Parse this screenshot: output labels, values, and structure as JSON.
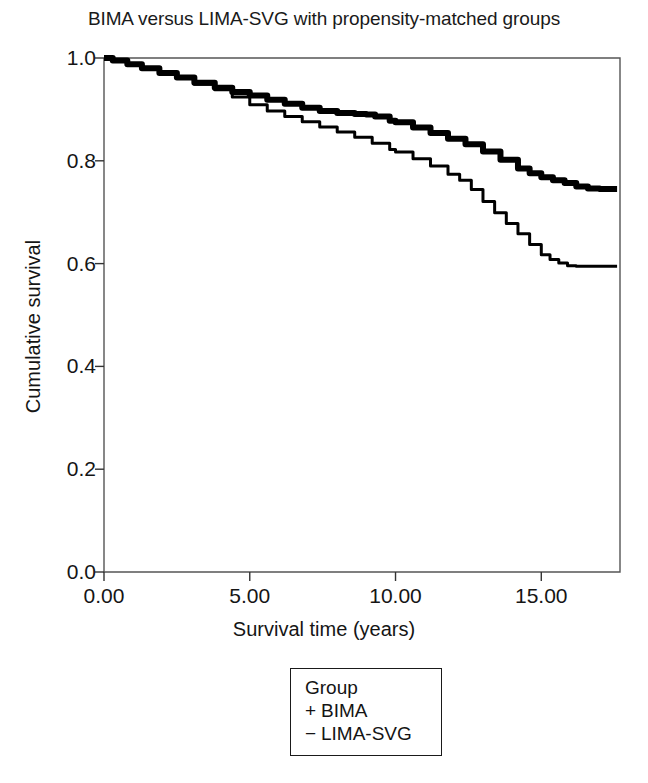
{
  "chart_data": {
    "type": "line",
    "title": "BIMA versus LIMA-SVG with propensity-matched groups",
    "subtitle": "",
    "xlabel": "Survival time (years)",
    "ylabel": "Cumulative survival",
    "xlim": [
      0,
      17.7
    ],
    "ylim": [
      0.0,
      1.0
    ],
    "grid": false,
    "legend_position": "below-plot",
    "legend_title": "Group",
    "xticks": [
      0,
      5,
      10,
      15
    ],
    "xtick_labels": [
      "0.00",
      "5.00",
      "10.00",
      "15.00"
    ],
    "yticks": [
      0.0,
      0.2,
      0.4,
      0.6,
      0.8,
      1.0
    ],
    "ytick_labels": [
      "0.0",
      "0.2",
      "0.4",
      "0.6",
      "0.8",
      "1.0"
    ],
    "series": [
      {
        "name": "BIMA",
        "marker": "+",
        "color": "#000000",
        "line_width": 6,
        "x": [
          0.0,
          0.3,
          0.8,
          1.3,
          1.9,
          2.5,
          3.1,
          3.8,
          4.4,
          5.0,
          5.6,
          6.2,
          6.8,
          7.4,
          8.0,
          8.6,
          9.0,
          9.3,
          9.8,
          10.0,
          10.6,
          11.2,
          11.8,
          12.4,
          13.0,
          13.6,
          14.2,
          14.6,
          15.0,
          15.4,
          15.8,
          16.2,
          16.6,
          17.0,
          17.4,
          17.6
        ],
        "y": [
          1.0,
          0.995,
          0.988,
          0.98,
          0.971,
          0.962,
          0.952,
          0.942,
          0.934,
          0.927,
          0.919,
          0.911,
          0.903,
          0.897,
          0.893,
          0.891,
          0.89,
          0.886,
          0.878,
          0.875,
          0.865,
          0.854,
          0.843,
          0.832,
          0.818,
          0.802,
          0.785,
          0.776,
          0.768,
          0.762,
          0.757,
          0.75,
          0.746,
          0.745,
          0.745,
          0.745
        ]
      },
      {
        "name": "LIMA-SVG",
        "marker": "−",
        "color": "#000000",
        "line_width": 3,
        "x": [
          0.0,
          0.3,
          0.8,
          1.3,
          1.9,
          2.5,
          3.1,
          3.8,
          4.4,
          5.0,
          5.6,
          6.2,
          6.8,
          7.4,
          8.0,
          8.6,
          9.2,
          9.8,
          10.0,
          10.6,
          11.2,
          11.8,
          12.2,
          12.6,
          13.0,
          13.4,
          13.8,
          14.2,
          14.6,
          15.0,
          15.3,
          15.6,
          15.9,
          16.2,
          16.6,
          17.0,
          17.4,
          17.6
        ],
        "y": [
          1.0,
          0.995,
          0.987,
          0.979,
          0.97,
          0.96,
          0.949,
          0.938,
          0.924,
          0.909,
          0.897,
          0.886,
          0.876,
          0.866,
          0.856,
          0.846,
          0.834,
          0.822,
          0.817,
          0.804,
          0.79,
          0.774,
          0.762,
          0.744,
          0.721,
          0.699,
          0.678,
          0.658,
          0.637,
          0.617,
          0.608,
          0.601,
          0.596,
          0.595,
          0.595,
          0.595,
          0.595,
          0.595
        ]
      }
    ],
    "annotations": []
  },
  "legend": {
    "title": "Group",
    "entries": [
      {
        "marker": "+",
        "label": "BIMA"
      },
      {
        "marker": "−",
        "label": "LIMA-SVG"
      }
    ]
  },
  "axes": {
    "axis_color": "#333333",
    "frame_color": "#555555"
  }
}
